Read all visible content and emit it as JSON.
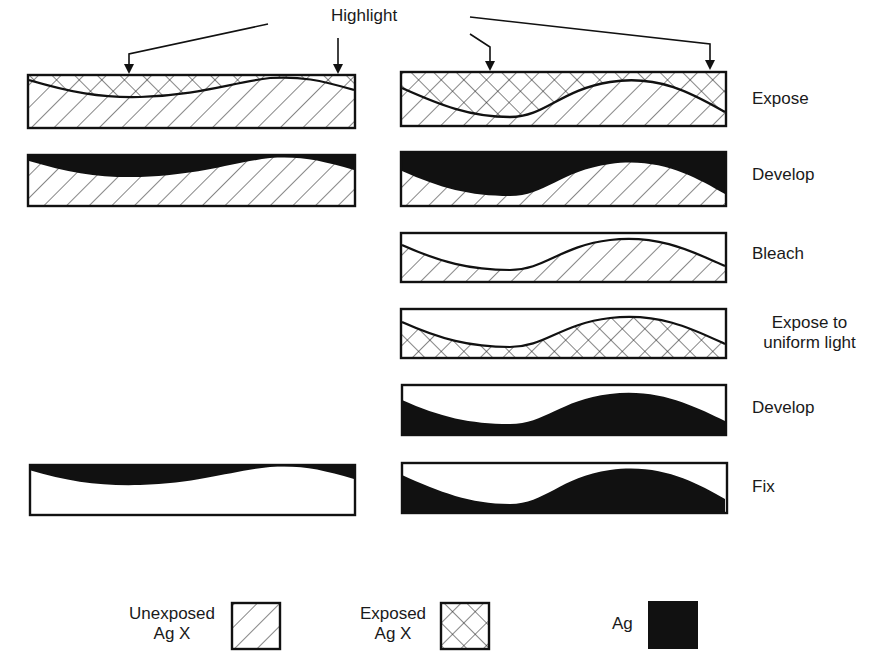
{
  "highlight_label": "Highlight",
  "steps": [
    {
      "label": "Expose",
      "left_panel": true
    },
    {
      "label": "Develop",
      "left_panel": true
    },
    {
      "label": "Bleach",
      "left_panel": false
    },
    {
      "label": "Expose to\nuniform light",
      "line1": "Expose to",
      "line2": "uniform light",
      "left_panel": false
    },
    {
      "label": "Develop",
      "left_panel": false
    },
    {
      "label": "Fix",
      "left_panel": true
    }
  ],
  "legend": [
    {
      "line1": "Unexposed",
      "line2": "Ag X",
      "pattern": "single-hatch"
    },
    {
      "line1": "Exposed",
      "line2": "Ag X",
      "pattern": "cross-hatch"
    },
    {
      "line1": "Ag",
      "pattern": "solid-black"
    }
  ],
  "colors": {
    "ink": "#111111",
    "paper": "#ffffff"
  }
}
